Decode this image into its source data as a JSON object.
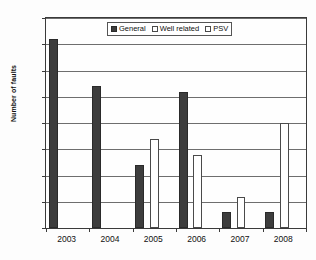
{
  "chart_data": {
    "type": "bar",
    "title": "",
    "xlabel": "",
    "ylabel": "Number of faults",
    "categories": [
      "2003",
      "2004",
      "2005",
      "2006",
      "2007",
      "2008"
    ],
    "series": [
      {
        "name": "General",
        "values": [
          36,
          27,
          12,
          26,
          3,
          3
        ],
        "color": "#3d3d3d",
        "swatch": "filled"
      },
      {
        "name": "Well related",
        "values": [
          0,
          0,
          17,
          14,
          6,
          20
        ],
        "color": "#ffffff",
        "swatch": "outline"
      },
      {
        "name": "PSV",
        "values": [
          0,
          0,
          0,
          0,
          0,
          0
        ],
        "color": "#ffffff",
        "swatch": "outline"
      }
    ],
    "ylim": [
      0,
      40
    ],
    "ytick_step": 5,
    "yticks": [
      "40",
      "35",
      "30",
      "25",
      "20",
      "15",
      "10",
      "5",
      "0"
    ],
    "grid": true,
    "legend_position": "top-center"
  },
  "axes": {
    "y_title": "Number of faults"
  },
  "legend": {
    "items": [
      {
        "label": "General"
      },
      {
        "label": "Well related"
      },
      {
        "label": "PSV"
      }
    ]
  }
}
